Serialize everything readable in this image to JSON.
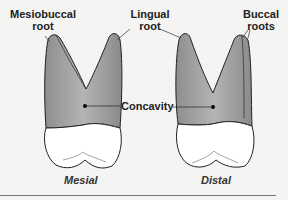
{
  "figure": {
    "labels": {
      "mesiobuccal_root": [
        "Mesiobuccal",
        "root"
      ],
      "lingual_root": [
        "Lingual",
        "root"
      ],
      "buccal_roots": [
        "Buccal",
        "roots"
      ],
      "concavity": "Concavity"
    },
    "captions": {
      "left": "Mesial",
      "right": "Distal"
    },
    "colors": {
      "root": "#9a9a9a",
      "crown": "#ffffff",
      "outline": "#222222",
      "background": "#f4f4f3"
    }
  }
}
